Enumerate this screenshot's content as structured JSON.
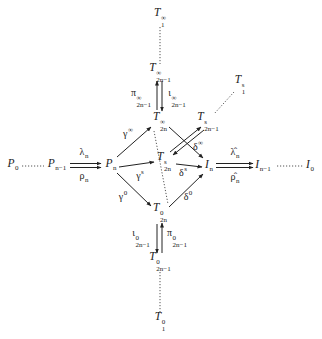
{
  "diagram": {
    "nodes": [
      {
        "id": "T1_inf",
        "base": "T",
        "sup": "∞",
        "sub": "1",
        "x": 160,
        "y": 18
      },
      {
        "id": "T2n1_inf",
        "base": "T",
        "sup": "∞",
        "sub": "2n−1",
        "x": 160,
        "y": 73
      },
      {
        "id": "T2n_inf",
        "base": "T",
        "sup": "∞",
        "sub": "2n",
        "x": 160,
        "y": 122
      },
      {
        "id": "T1_s",
        "base": "T",
        "sup": "s",
        "sub": "1",
        "x": 240,
        "y": 85
      },
      {
        "id": "T2n1_s",
        "base": "T",
        "sup": "s",
        "sub": "2n−1",
        "x": 208,
        "y": 122
      },
      {
        "id": "T2n_s",
        "base": "T",
        "sup": "s",
        "sub": "2n",
        "x": 164,
        "y": 162
      },
      {
        "id": "P0",
        "base": "P",
        "sup": "",
        "sub": "0",
        "x": 13,
        "y": 165
      },
      {
        "id": "Pn1",
        "base": "P",
        "sup": "",
        "sub": "n−1",
        "x": 57,
        "y": 165
      },
      {
        "id": "Pn",
        "base": "P",
        "sup": "",
        "sub": "n",
        "x": 111,
        "y": 165
      },
      {
        "id": "In",
        "base": "I",
        "sup": "",
        "sub": "n",
        "x": 209,
        "y": 166
      },
      {
        "id": "In1",
        "base": "I",
        "sup": "",
        "sub": "n−1",
        "x": 263,
        "y": 166
      },
      {
        "id": "I0",
        "base": "I",
        "sup": "",
        "sub": "0",
        "x": 310,
        "y": 166
      },
      {
        "id": "T2n_0",
        "base": "T",
        "sup": "0",
        "sub": "2n",
        "x": 160,
        "y": 213
      },
      {
        "id": "T2n1_0",
        "base": "T",
        "sup": "0",
        "sub": "2n−1",
        "x": 160,
        "y": 262
      },
      {
        "id": "T1_0",
        "base": "T",
        "sup": "0",
        "sub": "1",
        "x": 160,
        "y": 322
      }
    ],
    "edge_labels": [
      {
        "id": "lambda_n",
        "base": "λ",
        "sup": "",
        "sub": "n",
        "x": 84,
        "y": 153
      },
      {
        "id": "rho_n",
        "base": "ρ",
        "sup": "",
        "sub": "n",
        "x": 84,
        "y": 177
      },
      {
        "id": "lambda_hat_n",
        "base": "λ̂",
        "sup": "",
        "sub": "n",
        "x": 235,
        "y": 153
      },
      {
        "id": "rho_hat_n",
        "base": "ρ̂",
        "sup": "",
        "sub": "n",
        "x": 235,
        "y": 178
      },
      {
        "id": "gamma_inf",
        "base": "γ",
        "sup": "∞",
        "sub": "",
        "x": 128,
        "y": 133
      },
      {
        "id": "gamma_s",
        "base": "γ",
        "sup": "s",
        "sub": "",
        "x": 140,
        "y": 175
      },
      {
        "id": "gamma_0",
        "base": "γ",
        "sup": "0",
        "sub": "",
        "x": 123,
        "y": 196
      },
      {
        "id": "delta_inf",
        "base": "δ",
        "sup": "∞",
        "sub": "",
        "x": 198,
        "y": 146
      },
      {
        "id": "delta_s",
        "base": "δ",
        "sup": "s",
        "sub": "",
        "x": 183,
        "y": 172
      },
      {
        "id": "delta_0",
        "base": "δ",
        "sup": "0",
        "sub": "",
        "x": 188,
        "y": 196
      },
      {
        "id": "pi_inf",
        "base": "π",
        "sup": "∞",
        "sub": "2n−1",
        "x": 141,
        "y": 98
      },
      {
        "id": "iota_inf",
        "base": "ι",
        "sup": "∞",
        "sub": "2n−1",
        "x": 177,
        "y": 98
      },
      {
        "id": "iota_0",
        "base": "ι",
        "sup": "0",
        "sub": "2n−1",
        "x": 141,
        "y": 238
      },
      {
        "id": "pi_0",
        "base": "π",
        "sup": "0",
        "sub": "2n−1",
        "x": 177,
        "y": 238
      }
    ],
    "colors": {
      "line": "#222222",
      "dotted": "#555555",
      "background": "#ffffff"
    }
  }
}
